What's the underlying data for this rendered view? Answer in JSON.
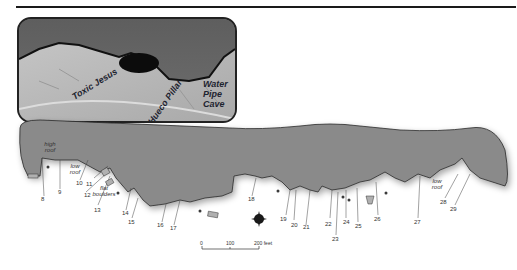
{
  "inset": {
    "labels": {
      "toxic_jesus": "Toxic Jesus",
      "hueco_pillar": "Hueco Pillar",
      "water_pipe_cave": "Water Pipe Cave"
    }
  },
  "map": {
    "area_notes": {
      "high_roof": "high roof",
      "low_roof_left": "low roof",
      "flat_boulders": "flat boulders",
      "low_roof_right": "low roof"
    },
    "route_numbers": [
      "8",
      "9",
      "10",
      "11",
      "12",
      "13",
      "14",
      "15",
      "16",
      "17",
      "18",
      "19",
      "20",
      "21",
      "22",
      "23",
      "24",
      "25",
      "26",
      "27",
      "28",
      "29"
    ]
  },
  "scale": {
    "ticks": [
      "0",
      "100",
      "200 feet"
    ]
  },
  "colors": {
    "rock_fill": "#8a8a8a",
    "outline": "#222222",
    "background": "#ffffff"
  }
}
